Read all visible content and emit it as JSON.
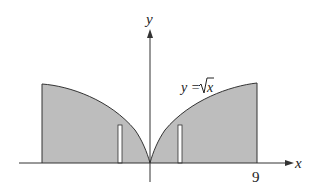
{
  "diagram": {
    "type": "region-under-curve",
    "curve_label": "y = √x",
    "curve_label_parts": {
      "lhs": "y =",
      "radicand": "x"
    },
    "axes": {
      "x_label": "x",
      "y_label": "y"
    },
    "tick_labels": {
      "x_end": "9"
    },
    "colors": {
      "fill": "#bdbdbd",
      "stroke": "#333333",
      "strip": "#ffffff"
    }
  }
}
